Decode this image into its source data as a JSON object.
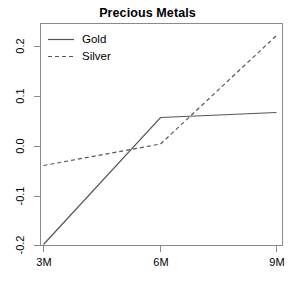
{
  "chart_data": {
    "type": "line",
    "title": "Precious Metals",
    "xlabel": "",
    "ylabel": "",
    "categories": [
      "3M",
      "6M",
      "9M"
    ],
    "x_tick_labels": [
      "3M",
      "6M",
      "9M"
    ],
    "y_tick_labels": [
      "0.2",
      "0.1",
      "0.0",
      "-0.1",
      "-0.2"
    ],
    "y_ticks": [
      0.2,
      0.1,
      0.0,
      -0.1,
      -0.2
    ],
    "ylim": [
      -0.2,
      0.23
    ],
    "xlim": [
      0,
      2
    ],
    "grid": false,
    "legend_position": "top-left",
    "series": [
      {
        "name": "Gold",
        "linestyle": "solid",
        "color": "#555555",
        "values": [
          -0.196,
          0.058,
          0.068
        ]
      },
      {
        "name": "Silver",
        "linestyle": "dashed",
        "color": "#555555",
        "values": [
          -0.038,
          0.005,
          0.222
        ]
      }
    ]
  },
  "legend": {
    "entries": [
      {
        "label": "Gold"
      },
      {
        "label": "Silver"
      }
    ]
  },
  "axes": {
    "frame_color": "#8a8a8a",
    "tick_color": "#8a8a8a"
  },
  "y_labels": {
    "t0": "0.2",
    "t1": "0.1",
    "t2": "0.0",
    "t3": "-0.1",
    "t4": "-0.2"
  },
  "x_labels": {
    "t0": "3M",
    "t1": "6M",
    "t2": "9M"
  }
}
